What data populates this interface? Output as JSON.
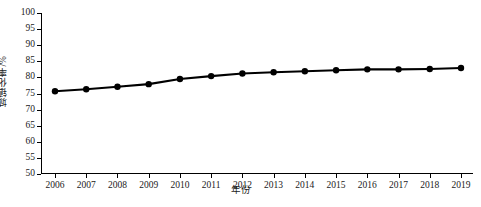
{
  "chart_data": {
    "type": "line",
    "title": "",
    "xlabel": "年份",
    "ylabel": "城镇化率/%",
    "categories": [
      "2006",
      "2007",
      "2008",
      "2009",
      "2010",
      "2011",
      "2012",
      "2013",
      "2014",
      "2015",
      "2016",
      "2017",
      "2018",
      "2019"
    ],
    "values": [
      75.7,
      76.3,
      77.1,
      77.9,
      79.5,
      80.4,
      81.2,
      81.6,
      81.9,
      82.2,
      82.5,
      82.5,
      82.6,
      82.9
    ],
    "series": [
      {
        "name": "城镇化率",
        "values": [
          75.7,
          76.3,
          77.1,
          77.9,
          79.5,
          80.4,
          81.2,
          81.6,
          81.9,
          82.2,
          82.5,
          82.5,
          82.6,
          82.9
        ]
      }
    ],
    "ylim": [
      50,
      100
    ],
    "yticks": [
      50,
      55,
      60,
      65,
      70,
      75,
      80,
      85,
      90,
      95,
      100
    ],
    "ytick_labels": [
      "50",
      "55",
      "60",
      "65",
      "70",
      "75",
      "80",
      "85",
      "90",
      "95",
      "100"
    ],
    "xticks": [
      "2006",
      "2007",
      "2008",
      "2009",
      "2010",
      "2011",
      "2012",
      "2013",
      "2014",
      "2015",
      "2016",
      "2017",
      "2018",
      "2019"
    ],
    "grid": false,
    "legend": null,
    "legend_position": "none",
    "marker": "circle",
    "line_color": "#000000",
    "marker_color": "#000000",
    "background_color": "#ffffff",
    "axis_color": "#000000"
  }
}
